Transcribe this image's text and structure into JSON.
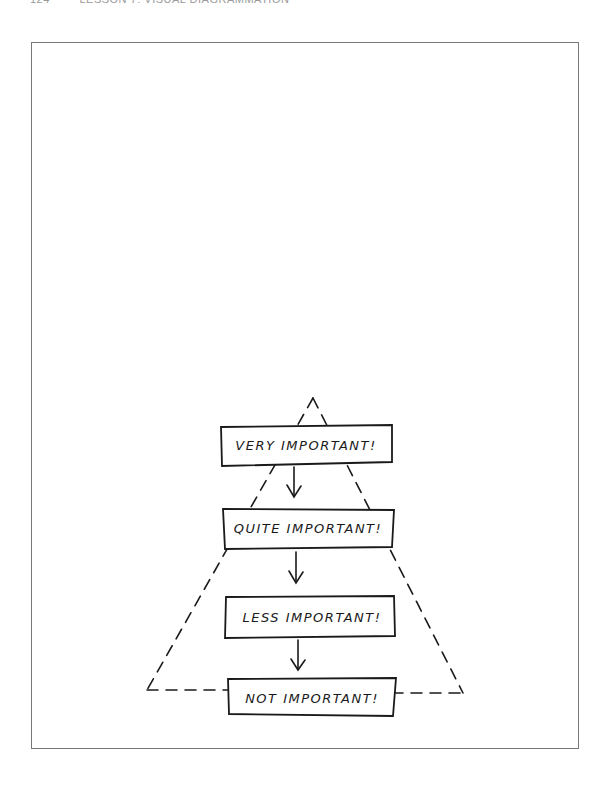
{
  "header": {
    "page_number": "124",
    "running_title": "LESSON 7: VISUAL DIAGRAMMATION"
  },
  "diagram": {
    "title": "",
    "type": "hierarchy-pyramid",
    "boxes": [
      {
        "label": "VERY IMPORTANT!"
      },
      {
        "label": "QUITE IMPORTANT!"
      },
      {
        "label": "LESS IMPORTANT!"
      },
      {
        "label": "NOT IMPORTANT!"
      }
    ],
    "edges": [
      {
        "from": "VERY IMPORTANT!",
        "to": "QUITE IMPORTANT!"
      },
      {
        "from": "QUITE IMPORTANT!",
        "to": "LESS IMPORTANT!"
      },
      {
        "from": "LESS IMPORTANT!",
        "to": "NOT IMPORTANT!"
      }
    ],
    "outline": "dashed-triangle",
    "colors": {
      "ink": "#1a1a1a",
      "frame": "#777777"
    }
  }
}
